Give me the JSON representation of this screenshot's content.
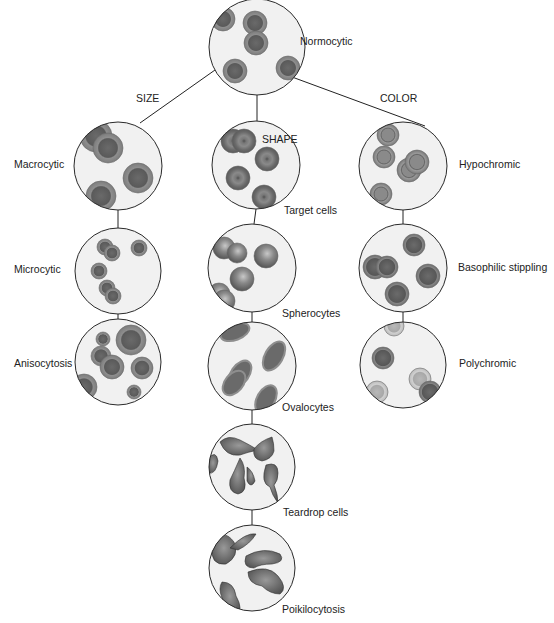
{
  "root": {
    "label": "Normocytic",
    "cx": 257,
    "cy": 47,
    "r": 48
  },
  "branches": {
    "size": {
      "label": "SIZE",
      "x": 136,
      "y": 92
    },
    "shape": {
      "label": "SHAPE",
      "x": 262,
      "y": 133
    },
    "color": {
      "label": "COLOR",
      "x": 380,
      "y": 92
    }
  },
  "nodes": [
    {
      "id": "macrocytic",
      "label": "Macrocytic",
      "cx": 118,
      "cy": 166,
      "r": 44,
      "lx": 14,
      "ly": 158,
      "type": "macro"
    },
    {
      "id": "microcytic",
      "label": "Microcytic",
      "cx": 118,
      "cy": 271,
      "r": 43,
      "lx": 14,
      "ly": 263,
      "type": "micro"
    },
    {
      "id": "anisocytosis",
      "label": "Anisocytosis",
      "cx": 118,
      "cy": 362,
      "r": 43,
      "lx": 14,
      "ly": 357,
      "type": "aniso"
    },
    {
      "id": "target-cells",
      "label": "Target cells",
      "cx": 256,
      "cy": 165,
      "r": 44,
      "lx": 284,
      "ly": 204,
      "type": "target"
    },
    {
      "id": "spherocytes",
      "label": "Spherocytes",
      "cx": 252,
      "cy": 268,
      "r": 44,
      "lx": 282,
      "ly": 307,
      "type": "sphero"
    },
    {
      "id": "ovalocytes",
      "label": "Ovalocytes",
      "cx": 252,
      "cy": 366,
      "r": 44,
      "lx": 282,
      "ly": 401,
      "type": "ovalo"
    },
    {
      "id": "teardrop-cells",
      "label": "Teardrop cells",
      "cx": 252,
      "cy": 467,
      "r": 43,
      "lx": 283,
      "ly": 506,
      "type": "tear"
    },
    {
      "id": "poikilocytosis",
      "label": "Poikilocytosis",
      "cx": 252,
      "cy": 568,
      "r": 43,
      "lx": 282,
      "ly": 603,
      "type": "poik"
    },
    {
      "id": "hypochromic",
      "label": "Hypochromic",
      "cx": 403,
      "cy": 166,
      "r": 44,
      "lx": 459,
      "ly": 158,
      "type": "hypo"
    },
    {
      "id": "basophilic-stippling",
      "label": "Basophilic stippling",
      "cx": 403,
      "cy": 268,
      "r": 44,
      "lx": 458,
      "ly": 261,
      "type": "baso"
    },
    {
      "id": "polychromic",
      "label": "Polychromic",
      "cx": 403,
      "cy": 365,
      "r": 43,
      "lx": 459,
      "ly": 357,
      "type": "poly"
    }
  ],
  "colors": {
    "circle_fill": "#f1f1f1",
    "circle_stroke": "#2a2a2a",
    "cell_rim": "#8e8e8e",
    "cell_center": "#5e5e5e",
    "pale_rim": "#c4c4c4",
    "pale_center": "#a9a9a9",
    "line": "#222222"
  }
}
